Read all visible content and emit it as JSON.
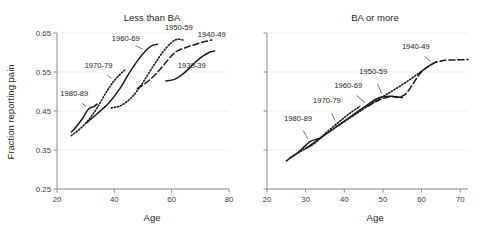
{
  "figure": {
    "ylabel": "Fraction reporting pain",
    "xlabel_left": "Age",
    "xlabel_right": "Age"
  },
  "chart_data": [
    {
      "type": "line",
      "title": "Less than BA",
      "xlabel": "Age",
      "ylabel": "Fraction reporting pain",
      "xlim": [
        20,
        80
      ],
      "ylim": [
        0.25,
        0.65
      ],
      "xticks": [
        20,
        40,
        60,
        80
      ],
      "yticks": [
        0.25,
        0.35,
        0.45,
        0.55,
        0.65
      ],
      "grid": true,
      "legend": "inline-annotations",
      "series": [
        {
          "name": "1980-89",
          "style": "solid",
          "x": [
            25,
            27,
            29,
            31,
            33,
            34
          ],
          "y": [
            0.396,
            0.412,
            0.432,
            0.455,
            0.462,
            0.468
          ]
        },
        {
          "name": "1970-79",
          "style": "dotted",
          "x": [
            25,
            28,
            31,
            34,
            37,
            40,
            43,
            44
          ],
          "y": [
            0.387,
            0.404,
            0.427,
            0.458,
            0.496,
            0.528,
            0.551,
            0.556
          ]
        },
        {
          "name": "1960-69",
          "style": "solid",
          "x": [
            30,
            34,
            38,
            42,
            45,
            48,
            51,
            53,
            55
          ],
          "y": [
            0.418,
            0.443,
            0.47,
            0.508,
            0.545,
            0.578,
            0.605,
            0.617,
            0.621
          ]
        },
        {
          "name": "1950-59",
          "style": "dotted",
          "x": [
            39,
            42,
            45,
            48,
            51,
            54,
            57,
            60,
            62,
            64
          ],
          "y": [
            0.458,
            0.463,
            0.478,
            0.502,
            0.535,
            0.57,
            0.602,
            0.626,
            0.634,
            0.632
          ]
        },
        {
          "name": "1940-49",
          "style": "dashed",
          "x": [
            48,
            51,
            54,
            57,
            60,
            62,
            65,
            68,
            71,
            74
          ],
          "y": [
            0.508,
            0.522,
            0.541,
            0.566,
            0.592,
            0.604,
            0.613,
            0.62,
            0.627,
            0.632
          ]
        },
        {
          "name": "1930-39",
          "style": "solid",
          "x": [
            58,
            61,
            64,
            67,
            70,
            73,
            75
          ],
          "y": [
            0.527,
            0.531,
            0.545,
            0.566,
            0.586,
            0.6,
            0.604
          ]
        }
      ],
      "annotations": [
        {
          "label": "1980-89",
          "x": 26.0,
          "y": 0.489
        },
        {
          "label": "1970-79",
          "x": 34.5,
          "y": 0.56
        },
        {
          "label": "1960-69",
          "x": 44.0,
          "y": 0.629
        },
        {
          "label": "1950-59",
          "x": 62.5,
          "y": 0.658
        },
        {
          "label": "1940-49",
          "x": 74.0,
          "y": 0.64
        },
        {
          "label": "1930-39",
          "x": 67.0,
          "y": 0.56
        }
      ]
    },
    {
      "type": "line",
      "title": "BA or more",
      "xlabel": "Age",
      "ylabel": "Fraction reporting pain",
      "xlim": [
        20,
        72
      ],
      "ylim": [
        0.25,
        0.65
      ],
      "xticks": [
        20,
        30,
        40,
        50,
        60,
        70
      ],
      "yticks": [
        0.25,
        0.35,
        0.45,
        0.55,
        0.65
      ],
      "grid": true,
      "legend": "inline-annotations",
      "series": [
        {
          "name": "1980-89",
          "style": "solid",
          "x": [
            25,
            27,
            29,
            31,
            33,
            34
          ],
          "y": [
            0.322,
            0.336,
            0.352,
            0.371,
            0.378,
            0.381
          ]
        },
        {
          "name": "1970-79",
          "style": "dotted",
          "x": [
            26,
            29,
            32,
            35,
            38,
            41,
            44
          ],
          "y": [
            0.33,
            0.348,
            0.365,
            0.392,
            0.417,
            0.441,
            0.462
          ]
        },
        {
          "name": "1960-69",
          "style": "solid",
          "x": [
            30,
            34,
            38,
            42,
            46,
            49,
            52,
            54,
            55
          ],
          "y": [
            0.354,
            0.382,
            0.41,
            0.438,
            0.466,
            0.484,
            0.488,
            0.486,
            0.484
          ]
        },
        {
          "name": "1950-59",
          "style": "dotted",
          "x": [
            38,
            42,
            46,
            50,
            53,
            56,
            59,
            62,
            64
          ],
          "y": [
            0.41,
            0.436,
            0.462,
            0.487,
            0.505,
            0.524,
            0.545,
            0.566,
            0.577
          ]
        },
        {
          "name": "1940-49",
          "style": "dashed",
          "x": [
            46,
            49,
            52,
            54,
            56,
            58,
            60,
            63,
            66,
            69,
            72
          ],
          "y": [
            0.462,
            0.478,
            0.487,
            0.485,
            0.495,
            0.523,
            0.551,
            0.572,
            0.58,
            0.581,
            0.582
          ]
        }
      ],
      "annotations": [
        {
          "label": "1980-89",
          "x": 28.0,
          "y": 0.424
        },
        {
          "label": "1970-79",
          "x": 35.5,
          "y": 0.47
        },
        {
          "label": "1960-69",
          "x": 41.0,
          "y": 0.508
        },
        {
          "label": "1950-59",
          "x": 47.5,
          "y": 0.545
        },
        {
          "label": "1940-49",
          "x": 58.5,
          "y": 0.608
        }
      ]
    }
  ]
}
